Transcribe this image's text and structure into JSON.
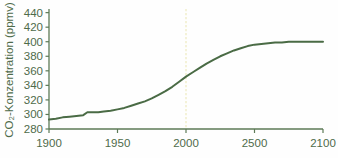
{
  "chart_data": {
    "type": "line",
    "title": "",
    "subtitle": "",
    "xlabel": "",
    "ylabel": "CO₂-Konzentration (ppmv)",
    "xlim": [
      1900,
      2100
    ],
    "ylim": [
      280,
      445
    ],
    "xticks": [
      1900,
      1950,
      2000,
      2500,
      2100
    ],
    "xtick_positions": [
      1900,
      1950,
      2000,
      2050,
      2100
    ],
    "yticks": [
      280,
      300,
      320,
      340,
      360,
      380,
      400,
      420,
      440
    ],
    "grid": false,
    "legend": null,
    "line_color": "#4a6b45",
    "annotation_line": {
      "name": "year-2000-marker",
      "x": 2000,
      "color": "#f2efcf",
      "style": "dotted"
    },
    "series": [
      {
        "name": "CO2-Konzentration",
        "color": "#4a6b45",
        "x": [
          1900,
          1905,
          1910,
          1915,
          1920,
          1925,
          1928,
          1932,
          1936,
          1940,
          1945,
          1950,
          1955,
          1960,
          1965,
          1970,
          1975,
          1980,
          1985,
          1990,
          1995,
          2000,
          2005,
          2010,
          2015,
          2020,
          2025,
          2030,
          2035,
          2040,
          2045,
          2050,
          2055,
          2060,
          2065,
          2070,
          2075,
          2080,
          2085,
          2090,
          2095,
          2100
        ],
        "y": [
          293,
          294,
          296,
          297,
          298,
          299,
          303,
          303,
          303,
          304,
          305,
          307,
          309,
          312,
          315,
          318,
          322,
          327,
          332,
          338,
          345,
          352,
          358,
          364,
          370,
          375,
          380,
          384,
          388,
          391,
          394,
          396,
          397,
          398,
          399,
          399,
          400,
          400,
          400,
          400,
          400,
          400
        ]
      }
    ]
  },
  "axes": {
    "y_axis_title": "CO₂-Konzentration (ppmv)"
  }
}
